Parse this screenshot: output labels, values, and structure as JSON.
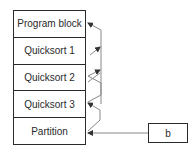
{
  "diagram": {
    "stack": {
      "rows": [
        {
          "label": "Program block"
        },
        {
          "label": "Quicksort 1"
        },
        {
          "label": "Quicksort 2"
        },
        {
          "label": "Quicksort 3"
        },
        {
          "label": "Partition"
        }
      ]
    },
    "external_box": {
      "label": "b"
    },
    "colors": {
      "line": "#2a2a2a",
      "arrow": "#555555",
      "background": "#ffffff"
    }
  }
}
